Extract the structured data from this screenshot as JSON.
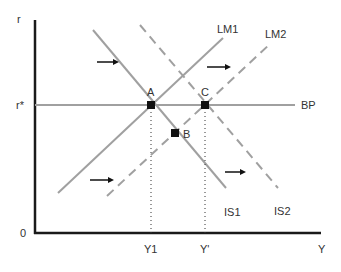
{
  "diagram": {
    "axes": {
      "y_label": "r",
      "x_label": "Y",
      "origin_label": "0",
      "r_star_label": "r*",
      "x_ticks": [
        {
          "label": "Y1",
          "x": 151
        },
        {
          "label": "Y'",
          "x": 205
        }
      ]
    },
    "curves": [
      {
        "id": "IS1",
        "label": "IS1",
        "style": "solid",
        "points": [
          [
            93,
            30
          ],
          [
            226,
            188
          ]
        ]
      },
      {
        "id": "IS2",
        "label": "IS2",
        "style": "dashed",
        "points": [
          [
            140,
            25
          ],
          [
            278,
            188
          ]
        ]
      },
      {
        "id": "LM1",
        "label": "LM1",
        "style": "solid",
        "points": [
          [
            58,
            193
          ],
          [
            223,
            38
          ]
        ]
      },
      {
        "id": "LM2",
        "label": "LM2",
        "style": "dashed",
        "points": [
          [
            107,
            196
          ],
          [
            271,
            43
          ]
        ]
      },
      {
        "id": "BP",
        "label": "BP",
        "style": "solid",
        "points": [
          [
            35,
            105
          ],
          [
            295,
            105
          ]
        ]
      }
    ],
    "points": [
      {
        "label": "A",
        "x": 151,
        "y": 105
      },
      {
        "label": "B",
        "x": 175,
        "y": 133
      },
      {
        "label": "C",
        "x": 205,
        "y": 105
      }
    ],
    "shift_arrows": [
      {
        "from": [
          97,
          62
        ],
        "to": [
          117,
          62
        ]
      },
      {
        "from": [
          207,
          67
        ],
        "to": [
          229,
          67
        ]
      },
      {
        "from": [
          90,
          180
        ],
        "to": [
          112,
          180
        ]
      },
      {
        "from": [
          225,
          172
        ],
        "to": [
          244,
          172
        ]
      }
    ],
    "colors": {
      "axis": "#1a1a1a",
      "curve": "#a0a0a0",
      "marker": "#111111",
      "text": "#333333"
    }
  }
}
